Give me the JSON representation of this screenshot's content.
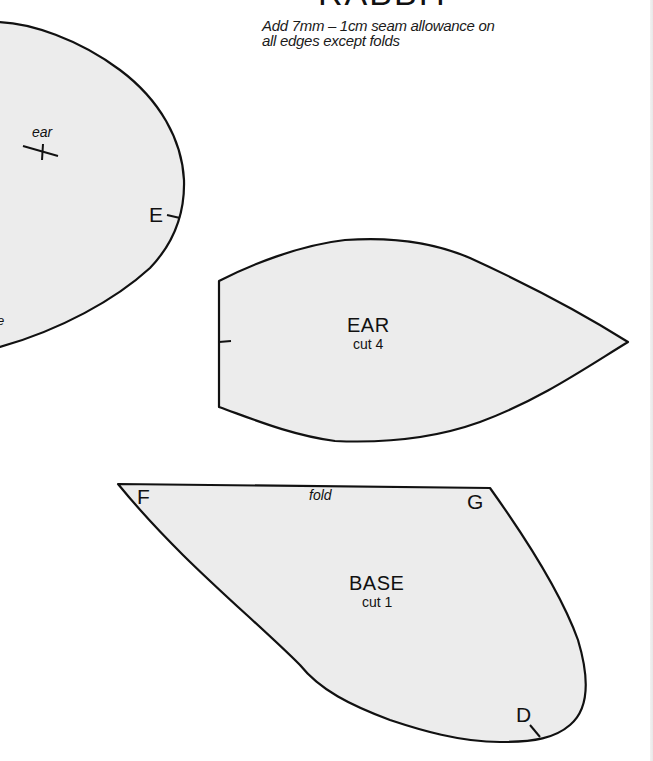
{
  "header": {
    "title": "RABBIT",
    "instructions": "Add 7mm – 1cm seam allowance on all edges except folds"
  },
  "colors": {
    "piece_fill": "#ececec",
    "outline": "#111111",
    "background": "#ffffff"
  },
  "pieces": {
    "head": {
      "ear_mark_label": "ear",
      "notch_label": "E",
      "partial_label": "e"
    },
    "ear": {
      "name": "EAR",
      "cut": "cut 4"
    },
    "base": {
      "name": "BASE",
      "cut": "cut 1",
      "fold_label": "fold",
      "corner_f": "F",
      "corner_g": "G",
      "notch_d": "D"
    }
  }
}
